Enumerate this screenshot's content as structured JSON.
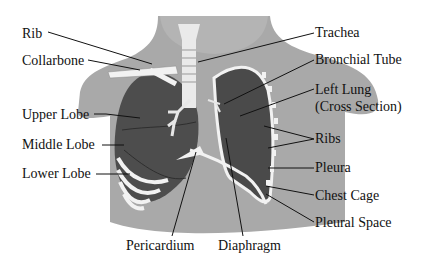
{
  "colors": {
    "background": "#ffffff",
    "body": "#a9a9a9",
    "body_dark": "#9a9a9a",
    "lung": "#4d4d4d",
    "bone": "#f2f2f2",
    "line": "#111111"
  },
  "labels": {
    "rib": "Rib",
    "collarbone": "Collarbone",
    "upper_lobe": "Upper Lobe",
    "middle_lobe": "Middle Lobe",
    "lower_lobe": "Lower Lobe",
    "pericardium": "Pericardium",
    "diaphragm": "Diaphragm",
    "trachea": "Trachea",
    "bronchial_tube": "Bronchial Tube",
    "left_lung_1": "Left Lung",
    "left_lung_2": "(Cross Section)",
    "ribs": "Ribs",
    "pleura": "Pleura",
    "chest_cage": "Chest Cage",
    "pleural_space": "Pleural Space"
  }
}
